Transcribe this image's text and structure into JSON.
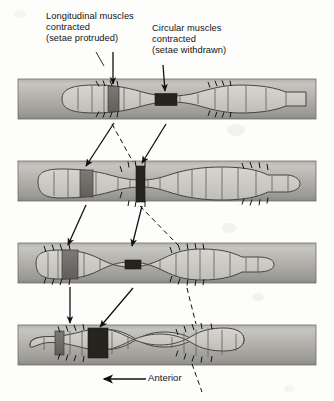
{
  "figure": {
    "type": "biological-process-diagram",
    "stage_count": 4,
    "background_color": "#fdfdfc"
  },
  "labels": {
    "longitudinal": "Longitudinal muscles\ncontracted\n(setae protruded)",
    "circular": "Circular muscles\ncontracted\n(setae withdrawn)",
    "anterior": "Anterior"
  },
  "colors": {
    "burrow_light": "#c9c7c2",
    "burrow_mid": "#a9a7a2",
    "burrow_dark": "#8e8c88",
    "worm_body": "#c4c2bd",
    "worm_segment": "#b6b4af",
    "longitudinal_band": "#6d6b67",
    "circular_band": "#2a2926",
    "outline": "#3a3936",
    "leader_line": "#1a1a1a",
    "text": "#141414"
  },
  "stages": [
    {
      "index": 1,
      "name": "stage-1",
      "y": 79,
      "height": 40,
      "description": "Anterior end extended; longitudinal contraction anchors mid-body, circular contraction thins a segment behind",
      "worm_left": 34,
      "worm_right": 316,
      "bulges": [
        {
          "name": "bulge-1",
          "center": 96,
          "width": 74
        },
        {
          "name": "bulge-2",
          "center": 222,
          "width": 70
        }
      ],
      "longitudinal_bands": [
        {
          "name": "longitudinal-band-a",
          "x": 108,
          "width": 11
        }
      ],
      "circular_bands": [
        {
          "name": "circular-band-a",
          "x": 155,
          "width": 22
        }
      ],
      "setae_groups": [
        {
          "name": "setae-group-1",
          "x": 100,
          "count": 4
        },
        {
          "name": "setae-group-2",
          "x": 213,
          "count": 5
        }
      ]
    },
    {
      "index": 2,
      "name": "stage-2",
      "y": 161,
      "height": 40,
      "description": "Wave of contraction passes backward; anterior segments elongate forward",
      "worm_left": 34,
      "worm_right": 300,
      "bulges": [
        {
          "name": "bulge-1",
          "center": 65,
          "width": 64
        },
        {
          "name": "bulge-2",
          "center": 185,
          "width": 72
        },
        {
          "name": "bulge-3",
          "center": 268,
          "width": 52
        }
      ],
      "longitudinal_bands": [
        {
          "name": "longitudinal-band-a",
          "x": 80,
          "width": 13
        }
      ],
      "circular_bands": [
        {
          "name": "circular-band-a",
          "x": 136,
          "width": 9
        }
      ],
      "setae_groups": [
        {
          "name": "setae-group-1",
          "x": 128,
          "count": 4
        },
        {
          "name": "setae-group-2",
          "x": 253,
          "count": 5
        }
      ]
    },
    {
      "index": 3,
      "name": "stage-3",
      "y": 243,
      "height": 40,
      "description": "Posterior segments drawn forward; setae anchored near the anterior bulge",
      "worm_left": 34,
      "worm_right": 286,
      "bulges": [
        {
          "name": "bulge-1",
          "center": 62,
          "width": 62
        },
        {
          "name": "bulge-2",
          "center": 172,
          "width": 66
        },
        {
          "name": "bulge-3",
          "center": 252,
          "width": 44
        }
      ],
      "longitudinal_bands": [
        {
          "name": "longitudinal-band-a",
          "x": 62,
          "width": 16
        }
      ],
      "circular_bands": [
        {
          "name": "circular-band-a",
          "x": 125,
          "width": 16
        }
      ],
      "setae_groups": [
        {
          "name": "setae-group-1",
          "x": 52,
          "count": 4
        },
        {
          "name": "setae-group-2",
          "x": 155,
          "count": 5
        }
      ]
    },
    {
      "index": 4,
      "name": "stage-4",
      "y": 325,
      "height": 40,
      "description": "Cycle repeats; worm has advanced anteriorly through the burrow",
      "worm_left": 34,
      "worm_right": 258,
      "bulges": [
        {
          "name": "bulge-1",
          "center": 76,
          "width": 60
        },
        {
          "name": "bulge-2",
          "center": 190,
          "width": 58
        }
      ],
      "longitudinal_bands": [
        {
          "name": "longitudinal-band-a",
          "x": 55,
          "width": 9
        }
      ],
      "circular_bands": [
        {
          "name": "circular-band-a",
          "x": 88,
          "width": 20
        }
      ],
      "setae_groups": [
        {
          "name": "setae-group-1",
          "x": 66,
          "count": 4
        },
        {
          "name": "setae-group-2",
          "x": 182,
          "count": 5
        }
      ]
    }
  ],
  "leaders": {
    "solid_arrows": 7,
    "dashed_lines": 6,
    "anterior_arrow_direction": "left"
  }
}
